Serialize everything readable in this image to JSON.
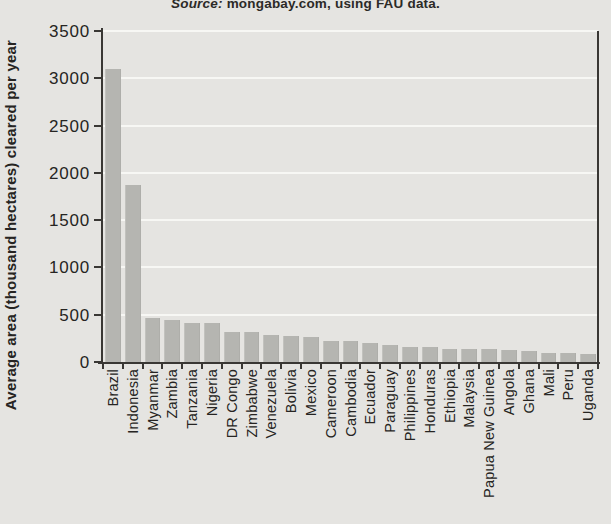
{
  "source_note": {
    "prefix": "Source:",
    "text": " mongabay.com, using FAU data."
  },
  "chart_data": {
    "type": "bar",
    "title": "",
    "xlabel": "",
    "ylabel": "Average area (thousand hectares) cleared per year",
    "ylim": [
      0,
      3500
    ],
    "ytick_interval": 500,
    "ytick_labels": [
      "0",
      "500",
      "1000",
      "1500",
      "2000",
      "2500",
      "3000",
      "3500"
    ],
    "grid": "horizontal",
    "legend": "none",
    "categories": [
      "Brazil",
      "Indonesia",
      "Myanmar",
      "Zambia",
      "Tanzania",
      "Nigeria",
      "DR Congo",
      "Zimbabwe",
      "Venezuela",
      "Bolivia",
      "Mexico",
      "Cameroon",
      "Cambodia",
      "Ecuador",
      "Paraguay",
      "Philippines",
      "Honduras",
      "Ethiopia",
      "Malaysia",
      "Papua New Guinea",
      "Angola",
      "Ghana",
      "Mali",
      "Peru",
      "Uganda"
    ],
    "values": [
      3103,
      1871,
      466,
      445,
      412,
      410,
      319,
      313,
      288,
      270,
      260,
      220,
      219,
      198,
      179,
      157,
      156,
      141,
      140,
      139,
      125,
      115,
      100,
      94,
      86
    ],
    "bar_color": "#b5b5b1",
    "background_color": "#e5e4e1",
    "gridline_color": "#f7f7f4",
    "axis_color": "#393734",
    "text_color": "#262422"
  }
}
